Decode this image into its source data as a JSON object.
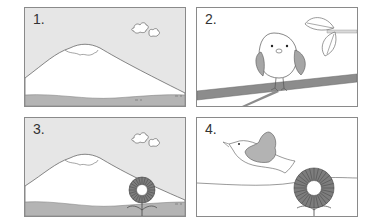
{
  "panels": [
    {
      "number": "1.",
      "scene": "mountain-with-clouds"
    },
    {
      "number": "2.",
      "scene": "bird-on-branch"
    },
    {
      "number": "3.",
      "scene": "mountain-with-clouds-and-flower"
    },
    {
      "number": "4.",
      "scene": "bird-flying-over-flower"
    }
  ],
  "colors": {
    "sky": "#e6e6e6",
    "mountain": "#ffffff",
    "ground": "#b4b4b4",
    "line": "#555555",
    "wing": "#b3b3b3",
    "branch": "#8c8c8c",
    "flower": "#7d7d7d"
  }
}
